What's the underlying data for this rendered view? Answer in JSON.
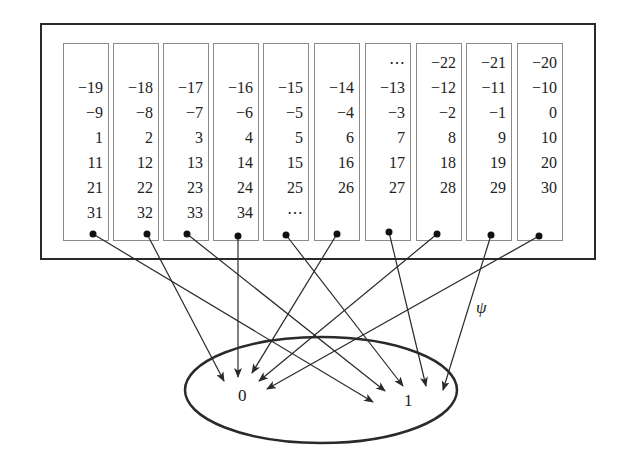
{
  "diagram": {
    "type": "mapping",
    "map_label": "ψ",
    "target_set": {
      "elements": [
        "0",
        "1"
      ]
    },
    "columns": [
      {
        "cells": [
          "",
          "−19",
          "−9",
          "1",
          "11",
          "21",
          "31"
        ],
        "maps_to": "1"
      },
      {
        "cells": [
          "",
          "−18",
          "−8",
          "2",
          "12",
          "22",
          "32"
        ],
        "maps_to": "0"
      },
      {
        "cells": [
          "",
          "−17",
          "−7",
          "3",
          "13",
          "23",
          "33"
        ],
        "maps_to": "1"
      },
      {
        "cells": [
          "",
          "−16",
          "−6",
          "4",
          "14",
          "24",
          "34"
        ],
        "maps_to": "0"
      },
      {
        "cells": [
          "",
          "−15",
          "−5",
          "5",
          "15",
          "25",
          "⋯"
        ],
        "maps_to": "1"
      },
      {
        "cells": [
          "",
          "−14",
          "−4",
          "6",
          "16",
          "26",
          ""
        ],
        "maps_to": "0"
      },
      {
        "cells": [
          "⋯",
          "−13",
          "−3",
          "7",
          "17",
          "27",
          ""
        ],
        "maps_to": "1"
      },
      {
        "cells": [
          "−22",
          "−12",
          "−2",
          "8",
          "18",
          "28",
          ""
        ],
        "maps_to": "0"
      },
      {
        "cells": [
          "−21",
          "−11",
          "−1",
          "9",
          "19",
          "29",
          ""
        ],
        "maps_to": "1"
      },
      {
        "cells": [
          "−20",
          "−10",
          "0",
          "10",
          "20",
          "30",
          ""
        ],
        "maps_to": "0"
      }
    ],
    "colors": {
      "stroke": "#2a2a2a",
      "column_border": "#8a8a8a",
      "text": "#222222"
    }
  }
}
